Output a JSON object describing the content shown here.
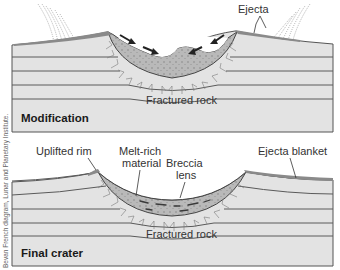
{
  "panels": [
    {
      "title": "Modification",
      "labels": {
        "ejecta": "Ejecta",
        "fractured_rock": "Fractured rock"
      }
    },
    {
      "title": "Final crater",
      "labels": {
        "uplifted_rim": "Uplifted rim",
        "melt_rich_line1": "Melt-rich",
        "melt_rich_line2": "material",
        "breccia_line1": "Breccia",
        "breccia_line2": "lens",
        "ejecta_blanket": "Ejecta blanket",
        "fractured_rock": "Fractured rock"
      }
    }
  ],
  "credit": "Bevan French diagram, Lunar and Planetary Institute.",
  "colors": {
    "rock": "#e3e3e3",
    "layer_line": "#5a5a5a",
    "breccia": "#b9b9b9",
    "ejecta": "#8a8a8a",
    "fracture": "#7a7a7a",
    "arrow": "#222222"
  }
}
